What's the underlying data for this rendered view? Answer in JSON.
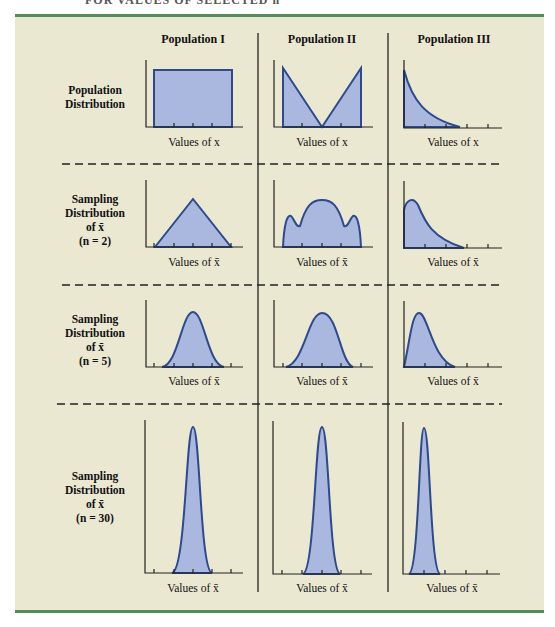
{
  "figure": {
    "cut_heading": "FOR VALUES OF SELECTED n",
    "columns": [
      {
        "label": "Population I"
      },
      {
        "label": "Population II"
      },
      {
        "label": "Population III"
      }
    ],
    "rows": [
      {
        "line1": "Population",
        "line2": "Distribution",
        "line3": "",
        "line4": "",
        "axis_label": "Values of x"
      },
      {
        "line1": "Sampling",
        "line2": "Distribution",
        "line3": "of x̄",
        "line4": "(n = 2)",
        "axis_label": "Values of x̄"
      },
      {
        "line1": "Sampling",
        "line2": "Distribution",
        "line3": "of x̄",
        "line4": "(n = 5)",
        "axis_label": "Values of x̄"
      },
      {
        "line1": "Sampling",
        "line2": "Distribution",
        "line3": "of x̄",
        "line4": "(n = 30)",
        "axis_label": "Values of x̄"
      }
    ],
    "colors": {
      "panel_bg": "#ebe8d2",
      "rule_green": "#4f8f5a",
      "curve_stroke": "#2e4a8c",
      "curve_fill": "#aab8e0"
    }
  }
}
